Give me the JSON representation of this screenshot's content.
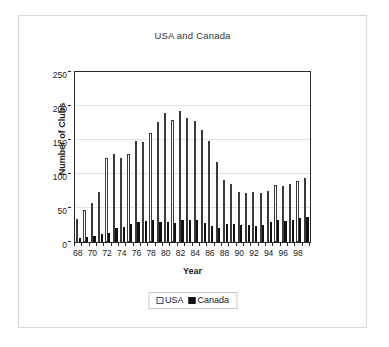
{
  "chart_data": {
    "type": "bar",
    "title": "USA and Canada",
    "xlabel": "Year",
    "ylabel": "Number of Clubs",
    "ylim": [
      0,
      250
    ],
    "yticks": [
      0,
      50,
      100,
      150,
      200,
      250
    ],
    "grid": true,
    "legend_position": "bottom",
    "categories": [
      "68",
      "69",
      "70",
      "71",
      "72",
      "73",
      "74",
      "75",
      "76",
      "77",
      "78",
      "79",
      "80",
      "81",
      "82",
      "83",
      "84",
      "85",
      "86",
      "87",
      "88",
      "89",
      "90",
      "91",
      "92",
      "93",
      "94",
      "95",
      "96",
      "97",
      "98",
      "99"
    ],
    "tick_labels": [
      "68",
      "",
      "70",
      "",
      "72",
      "",
      "74",
      "",
      "76",
      "",
      "78",
      "",
      "80",
      "",
      "82",
      "",
      "84",
      "",
      "86",
      "",
      "88",
      "",
      "90",
      "",
      "92",
      "",
      "94",
      "",
      "96",
      "",
      "98",
      ""
    ],
    "series": [
      {
        "name": "USA",
        "color": "#ffffff",
        "border_color": "#3a3a3a",
        "values": [
          34,
          47,
          57,
          73,
          123,
          129,
          123,
          129,
          148,
          147,
          160,
          177,
          190,
          179,
          193,
          182,
          178,
          164,
          148,
          117,
          91,
          86,
          74,
          72,
          74,
          72,
          75,
          84,
          83,
          86,
          89,
          94
        ]
      },
      {
        "name": "Canada",
        "color": "#111111",
        "border_color": "#111111",
        "values": [
          6,
          7,
          9,
          12,
          13,
          20,
          22,
          26,
          30,
          31,
          32,
          30,
          29,
          28,
          32,
          33,
          33,
          28,
          24,
          21,
          27,
          26,
          25,
          25,
          24,
          25,
          29,
          32,
          31,
          32,
          35,
          37
        ]
      }
    ]
  },
  "legend": {
    "items": [
      {
        "label": "USA",
        "swatch": "usa-swatch"
      },
      {
        "label": "Canada",
        "swatch": "canada-swatch"
      }
    ]
  }
}
